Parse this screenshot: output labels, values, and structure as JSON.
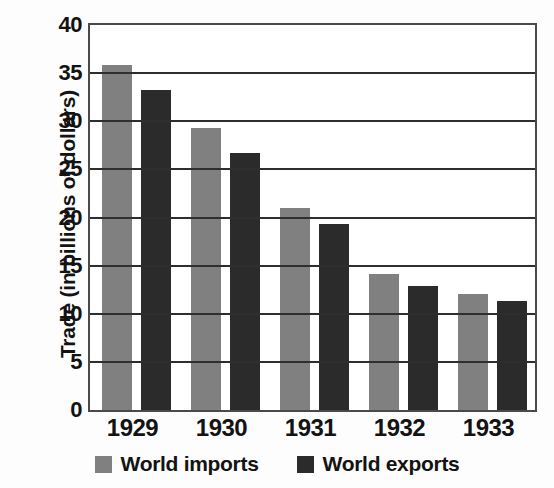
{
  "chart_data": {
    "type": "bar",
    "title": "",
    "xlabel": "",
    "ylabel": "Trade (in billions of dollars)",
    "categories": [
      "1929",
      "1930",
      "1931",
      "1932",
      "1933"
    ],
    "series": [
      {
        "name": "World imports",
        "color": "#808080",
        "values": [
          35.8,
          29.3,
          21.0,
          14.1,
          12.1
        ]
      },
      {
        "name": "World exports",
        "color": "#2b2b2b",
        "values": [
          33.2,
          26.7,
          19.3,
          12.9,
          11.3
        ]
      }
    ],
    "ylim": [
      0,
      40
    ],
    "yticks": [
      0,
      5,
      10,
      15,
      20,
      25,
      30,
      35,
      40
    ],
    "ytick_labels": [
      "0",
      "5",
      "10",
      "15",
      "20",
      "25",
      "30",
      "35",
      "40"
    ],
    "grid": true,
    "legend_position": "bottom",
    "axis_color": "#2e2e2e",
    "plot_background": "#ffffff"
  }
}
